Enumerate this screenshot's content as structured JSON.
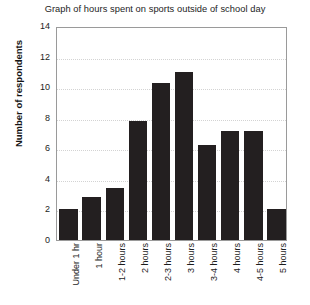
{
  "chart_data": {
    "type": "bar",
    "title": "Graph of hours spent on sports outside of school day",
    "xlabel": "",
    "ylabel": "Number of respondents",
    "categories": [
      "Under 1 hr",
      "1 hour",
      "1-2 hours",
      "2 hours",
      "2-3 hours",
      "3 hours",
      "3-4 hours",
      "4 hours",
      "4-5 hours",
      "5 hours"
    ],
    "values": [
      2,
      2.8,
      3.4,
      7.8,
      10.3,
      11,
      6.2,
      7.1,
      7.1,
      2
    ],
    "ylim": [
      0,
      14
    ],
    "yticks": [
      0,
      2,
      4,
      6,
      8,
      10,
      12,
      14
    ],
    "grid": "horizontal-dotted",
    "legend": "none",
    "bar_color": "#231f20"
  }
}
